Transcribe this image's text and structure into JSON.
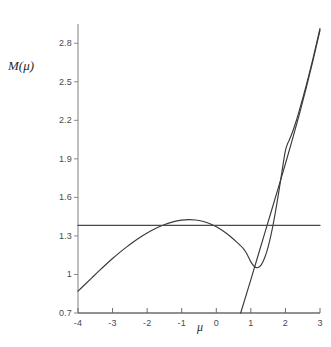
{
  "chart_data": {
    "type": "line",
    "title": "",
    "xlabel": "μ",
    "ylabel": "M(μ)",
    "xlim": [
      -4,
      3
    ],
    "ylim": [
      0.7,
      2.95
    ],
    "grid": false,
    "legend": null,
    "xticks": [
      "-4",
      "-3",
      "-2",
      "-1",
      "0",
      "1",
      "2",
      "3"
    ],
    "xtick_values": [
      -4,
      -3,
      -2,
      -1,
      0,
      1,
      2,
      3
    ],
    "yticks": [
      "0.7",
      "1",
      "1.3",
      "1.6",
      "1.9",
      "2.2",
      "2.5",
      "2.8"
    ],
    "ytick_values": [
      0.7,
      1.0,
      1.3,
      1.6,
      1.9,
      2.2,
      2.5,
      2.8
    ],
    "series": [
      {
        "name": "M(mu) curve",
        "color": "#3a3a3a",
        "points": [
          [
            -4.0,
            0.87
          ],
          [
            -3.8,
            0.922
          ],
          [
            -3.6,
            0.974
          ],
          [
            -3.4,
            1.026
          ],
          [
            -3.2,
            1.076
          ],
          [
            -3.0,
            1.124
          ],
          [
            -2.8,
            1.17
          ],
          [
            -2.6,
            1.213
          ],
          [
            -2.4,
            1.253
          ],
          [
            -2.2,
            1.29
          ],
          [
            -2.0,
            1.323
          ],
          [
            -1.8,
            1.352
          ],
          [
            -1.6,
            1.377
          ],
          [
            -1.4,
            1.398
          ],
          [
            -1.2,
            1.413
          ],
          [
            -1.0,
            1.423
          ],
          [
            -0.8,
            1.427
          ],
          [
            -0.6,
            1.424
          ],
          [
            -0.4,
            1.414
          ],
          [
            -0.2,
            1.397
          ],
          [
            0.0,
            1.372
          ],
          [
            0.2,
            1.339
          ],
          [
            0.4,
            1.298
          ],
          [
            0.6,
            1.25
          ],
          [
            0.8,
            1.196
          ],
          [
            0.9,
            1.152
          ],
          [
            1.0,
            1.098
          ],
          [
            1.1,
            1.062
          ],
          [
            1.2,
            1.053
          ],
          [
            1.3,
            1.075
          ],
          [
            1.4,
            1.13
          ],
          [
            1.5,
            1.215
          ],
          [
            1.6,
            1.33
          ],
          [
            1.7,
            1.47
          ],
          [
            1.8,
            1.63
          ],
          [
            1.9,
            1.8
          ],
          [
            1.95,
            1.888
          ],
          [
            2.0,
            1.965
          ],
          [
            2.05,
            2.01
          ],
          [
            2.1,
            2.04
          ],
          [
            2.2,
            2.105
          ],
          [
            2.3,
            2.185
          ],
          [
            2.4,
            2.275
          ],
          [
            2.5,
            2.37
          ],
          [
            2.6,
            2.47
          ],
          [
            2.7,
            2.575
          ],
          [
            2.8,
            2.685
          ],
          [
            2.9,
            2.8
          ],
          [
            3.0,
            2.915
          ]
        ]
      },
      {
        "name": "tangent line",
        "color": "#3a3a3a",
        "points": [
          [
            0.705,
            0.7
          ],
          [
            1.0,
            0.96
          ],
          [
            1.2,
            1.14
          ],
          [
            1.4,
            1.32
          ],
          [
            1.6,
            1.5
          ],
          [
            1.8,
            1.68
          ],
          [
            2.0,
            1.862
          ],
          [
            2.2,
            2.05
          ],
          [
            2.4,
            2.245
          ],
          [
            2.6,
            2.45
          ],
          [
            2.8,
            2.668
          ],
          [
            3.0,
            2.9
          ]
        ]
      },
      {
        "name": "horizontal threshold",
        "color": "#4a4a4a",
        "constant_y": 1.382,
        "points": [
          [
            -4.0,
            1.382
          ],
          [
            3.0,
            1.382
          ]
        ]
      }
    ]
  },
  "axes": {
    "x_axis_color": "#6b6b6b",
    "y_axis_color": "#8a8a8a",
    "xlabel": "μ",
    "ylabel_m": "M",
    "ylabel_paren_open": "(",
    "ylabel_mu": "μ",
    "ylabel_paren_close": ")"
  },
  "background": "#ffffff"
}
